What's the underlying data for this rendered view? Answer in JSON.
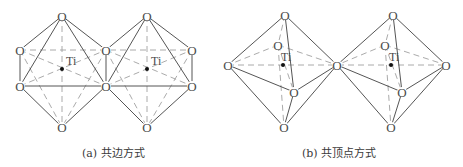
{
  "figure": {
    "subfigures": [
      {
        "id": "a",
        "caption": "(a) 共边方式",
        "mode": "edge-sharing",
        "atom_label_O": "O",
        "atom_label_Ti": "Ti",
        "octahedra": [
          {
            "ti": [
              62,
              69
            ]
          },
          {
            "ti": [
              147,
              69
            ]
          }
        ]
      },
      {
        "id": "b",
        "caption": "(b) 共顶点方式",
        "mode": "corner-sharing",
        "atom_label_O": "O",
        "atom_label_Ti": "Ti",
        "octahedra": [
          {
            "ti": [
              283,
              65
            ]
          },
          {
            "ti": [
              391,
              65
            ]
          }
        ]
      }
    ],
    "colors": {
      "solid_line": "#555555",
      "dashed_line": "#9a9a9a",
      "ti_dot": "#111111"
    }
  }
}
